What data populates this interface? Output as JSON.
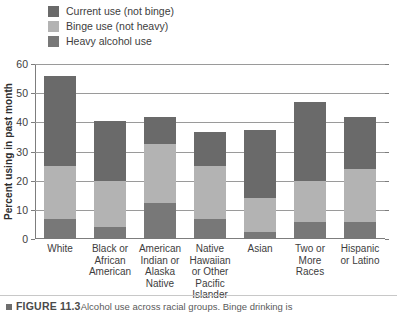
{
  "chart_data": {
    "type": "bar",
    "subtype": "stacked-bar",
    "title": "",
    "xlabel": "",
    "ylabel": "Percent using in past month",
    "ylim": [
      0,
      60
    ],
    "ytick_step": 10,
    "yticks": [
      0,
      10,
      20,
      30,
      40,
      50,
      60
    ],
    "grid": "horizontal",
    "legend_position": "top-left",
    "categories": [
      "White",
      "Black or African American",
      "American Indian or Alaska Native",
      "Native Hawaiian or Other Pacific Islander",
      "Asian",
      "Two or More Races",
      "Hispanic or Latino"
    ],
    "category_lines": [
      [
        "White"
      ],
      [
        "Black or",
        "African",
        "American"
      ],
      [
        "American",
        "Indian or",
        "Alaska",
        "Native"
      ],
      [
        "Native",
        "Hawaiian",
        "or Other",
        "Pacific",
        "Islander"
      ],
      [
        "Asian"
      ],
      [
        "Two or",
        "More",
        "Races"
      ],
      [
        "Hispanic",
        "or Latino"
      ]
    ],
    "series": [
      {
        "name": "Heavy alcohol use",
        "color": "#787878",
        "values": [
          7.0,
          4.0,
          12.5,
          7.0,
          2.5,
          6.0,
          6.0
        ]
      },
      {
        "name": "Binge use (not heavy)",
        "color": "#b3b3b3",
        "values": [
          18.0,
          16.0,
          20.0,
          18.0,
          11.5,
          14.0,
          18.0
        ]
      },
      {
        "name": "Current use (not binge)",
        "color": "#6a6a6a",
        "values": [
          31.0,
          20.5,
          9.5,
          11.7,
          23.5,
          27.0,
          18.0
        ]
      }
    ],
    "cumulative_tops": {
      "heavy": [
        7.0,
        4.0,
        12.5,
        7.0,
        2.5,
        6.0,
        6.0
      ],
      "binge": [
        25.0,
        20.0,
        32.5,
        25.0,
        14.0,
        20.0,
        24.0
      ],
      "total": [
        56.0,
        40.5,
        42.0,
        36.7,
        37.5,
        47.0,
        42.0
      ]
    }
  },
  "legend": {
    "items": [
      {
        "label": "Current use (not binge)",
        "color": "#6a6a6a"
      },
      {
        "label": "Binge use (not heavy)",
        "color": "#b3b3b3"
      },
      {
        "label": "Heavy alcohol use",
        "color": "#787878"
      }
    ]
  },
  "axis": {
    "y_title": "Percent using in past month",
    "y_labels": [
      "60",
      "50",
      "40",
      "30",
      "20",
      "10",
      "0"
    ]
  },
  "caption": {
    "bullet": "",
    "figure_number": "FIGURE 11.3",
    "text": "Alcohol use across racial groups. Binge drinking is"
  }
}
